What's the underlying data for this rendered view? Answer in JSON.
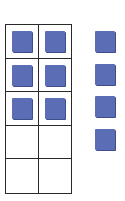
{
  "ten_frame": {
    "rows": 5,
    "columns": 2,
    "filled_cells": 6,
    "counter_color": "#5b6db5",
    "cells": [
      {
        "filled": true
      },
      {
        "filled": true
      },
      {
        "filled": true
      },
      {
        "filled": true
      },
      {
        "filled": true
      },
      {
        "filled": true
      },
      {
        "filled": false
      },
      {
        "filled": false
      },
      {
        "filled": false
      },
      {
        "filled": false
      }
    ]
  },
  "extra_counters": {
    "count": 4,
    "color": "#5b6db5"
  }
}
